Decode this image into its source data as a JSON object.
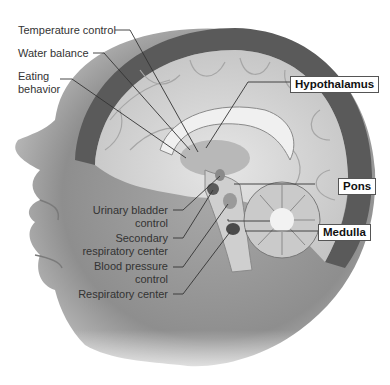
{
  "figure": {
    "left_labels": [
      {
        "id": "temperature-control",
        "text": "Temperature control"
      },
      {
        "id": "water-balance",
        "text": "Water balance"
      },
      {
        "id": "eating-behavior",
        "line1": "Eating",
        "line2": "behavior"
      },
      {
        "id": "urinary-bladder-control",
        "line1": "Urinary bladder",
        "line2": "control"
      },
      {
        "id": "secondary-respiratory-center",
        "line1": "Secondary",
        "line2": "respiratory center"
      },
      {
        "id": "blood-pressure-control",
        "line1": "Blood pressure",
        "line2": "control"
      },
      {
        "id": "respiratory-center",
        "text": "Respiratory center"
      }
    ],
    "boxed_labels": [
      {
        "id": "hypothalamus",
        "text": "Hypothalamus"
      },
      {
        "id": "pons",
        "text": "Pons"
      },
      {
        "id": "medulla",
        "text": "Medulla"
      }
    ],
    "colors": {
      "background": "#ffffff",
      "skin": "#9a9a9a",
      "skull": "#5a5a5a",
      "brain": "#d6d6d6",
      "leader_line": "#333333",
      "label_text": "#333333"
    }
  }
}
